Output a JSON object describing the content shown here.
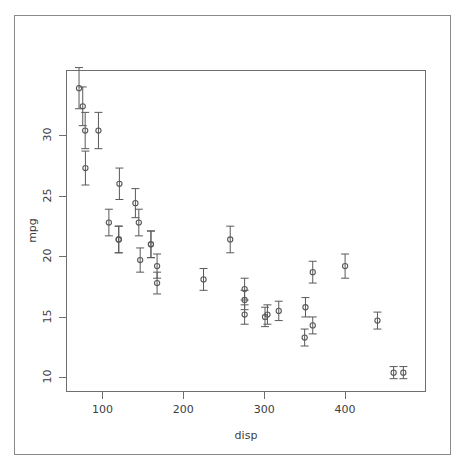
{
  "chart_data": {
    "type": "scatter",
    "title": "",
    "subtitle": "",
    "xlabel": "disp",
    "ylabel": "mpg",
    "xlim": [
      55,
      500
    ],
    "ylim": [
      8.8,
      35.4
    ],
    "xticks": [
      100,
      200,
      300,
      400
    ],
    "xtick_labels": [
      "100",
      "200",
      "300",
      "400"
    ],
    "yticks": [
      10,
      15,
      20,
      25,
      30
    ],
    "ytick_labels": [
      "10",
      "15",
      "20",
      "25",
      "30"
    ],
    "grid": false,
    "legend": null,
    "error_bars": "vertical",
    "point_marker": "open-circle",
    "point_color": "#595959",
    "errorbar_color": "#595959",
    "axis_color": "#6e6e6e",
    "background_color": "#ffffff",
    "series": [
      {
        "name": "mpg vs disp",
        "x": [
          71.1,
          75.7,
          78.7,
          79.0,
          95.1,
          108.0,
          120.1,
          120.3,
          121.0,
          140.8,
          145.0,
          146.7,
          160.0,
          160.0,
          167.6,
          167.6,
          225.0,
          258.0,
          275.8,
          275.8,
          275.8,
          301.0,
          304.0,
          318.0,
          350.0,
          351.0,
          360.0,
          360.0,
          400.0,
          440.0,
          460.0,
          472.0
        ],
        "y": [
          33.9,
          32.4,
          30.4,
          27.3,
          30.4,
          22.8,
          21.4,
          21.4,
          26.0,
          24.4,
          22.8,
          19.7,
          21.0,
          21.0,
          19.2,
          17.8,
          18.1,
          21.4,
          17.3,
          16.4,
          15.2,
          15.0,
          15.2,
          15.5,
          13.3,
          15.8,
          18.7,
          14.3,
          19.2,
          14.7,
          10.4,
          10.4
        ],
        "yerr": [
          1.7,
          1.6,
          1.5,
          1.4,
          1.5,
          1.1,
          1.1,
          1.1,
          1.3,
          1.2,
          1.1,
          1.0,
          1.1,
          1.1,
          1.0,
          0.9,
          0.9,
          1.1,
          0.9,
          0.8,
          0.8,
          0.8,
          0.8,
          0.8,
          0.7,
          0.8,
          0.9,
          0.7,
          1.0,
          0.7,
          0.5,
          0.5
        ]
      }
    ]
  },
  "axes": {
    "x_title": "disp",
    "y_title": "mpg"
  }
}
